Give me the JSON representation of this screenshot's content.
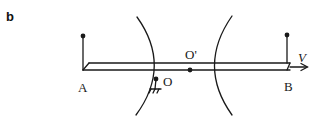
{
  "figure": {
    "panel_label": "b",
    "labels": {
      "point_a": "A",
      "point_b": "B",
      "pivot_o": "O",
      "center_o_prime": "O'",
      "velocity": "V"
    },
    "colors": {
      "stroke": "#1a1a1a",
      "background": "#ffffff"
    }
  }
}
